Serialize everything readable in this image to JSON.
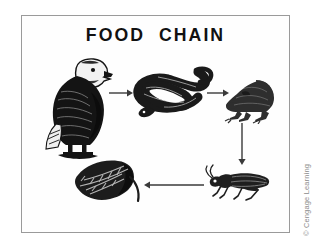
{
  "figure": {
    "title": "FOOD  CHAIN",
    "credit": "© Cengage Learning",
    "frame": {
      "border_color": "#9a9a9a",
      "background": "#fefefe"
    },
    "ink_color": "#1a1a1a",
    "arrow_color": "#3a3a3a"
  },
  "organisms": [
    {
      "id": "eagle",
      "label": "eagle",
      "role": "tertiary-consumer",
      "position": "top-left"
    },
    {
      "id": "snake",
      "label": "snake",
      "role": "secondary-consumer",
      "position": "top-center"
    },
    {
      "id": "frog",
      "label": "frog",
      "role": "consumer",
      "position": "top-right"
    },
    {
      "id": "grasshopper",
      "label": "grasshopper",
      "role": "primary-consumer",
      "position": "bottom-right"
    },
    {
      "id": "leaf",
      "label": "leaf",
      "role": "producer",
      "position": "bottom-left"
    }
  ],
  "arrows": [
    {
      "id": "arrow-eagle-snake",
      "from": "snake",
      "to": "eagle",
      "direction": "right"
    },
    {
      "id": "arrow-snake-frog",
      "from": "frog",
      "to": "snake",
      "direction": "right"
    },
    {
      "id": "arrow-frog-hopper",
      "from": "grasshopper",
      "to": "frog",
      "direction": "down"
    },
    {
      "id": "arrow-hopper-leaf",
      "from": "leaf",
      "to": "grasshopper",
      "direction": "left"
    }
  ]
}
